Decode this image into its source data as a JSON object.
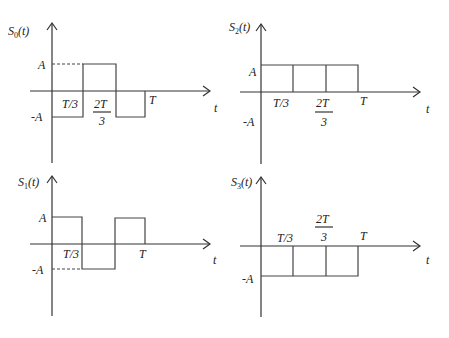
{
  "panels": [
    {
      "id": "s0",
      "title": "S",
      "subscript": "0",
      "arg": "(t)",
      "axis_label": "t",
      "levels": {
        "pos": "A",
        "neg": "-A"
      },
      "ticks": {
        "t1": "T/3",
        "t2_num": "2T",
        "t2_den": "3",
        "t3": "T"
      },
      "segments": [
        -1,
        1,
        -1
      ]
    },
    {
      "id": "s2",
      "title": "S",
      "subscript": "2",
      "arg": "(t)",
      "axis_label": "t",
      "levels": {
        "pos": "A",
        "neg": "-A"
      },
      "ticks": {
        "t1": "T/3",
        "t2_num": "2T",
        "t2_den": "3",
        "t3": "T"
      },
      "segments": [
        1,
        1,
        1
      ]
    },
    {
      "id": "s1",
      "title": "S",
      "subscript": "1",
      "arg": "(t)",
      "axis_label": "t",
      "levels": {
        "pos": "A",
        "neg": "-A"
      },
      "ticks": {
        "t1": "T/3",
        "t3": "T"
      },
      "segments": [
        1,
        -1,
        1
      ]
    },
    {
      "id": "s3",
      "title": "S",
      "subscript": "3",
      "arg": "(t)",
      "axis_label": "t",
      "levels": {
        "neg": "-A"
      },
      "ticks": {
        "t1": "T/3",
        "t2_num": "2T",
        "t2_den": "3",
        "t3": "T"
      },
      "segments": [
        -1,
        -1,
        -1
      ]
    }
  ]
}
